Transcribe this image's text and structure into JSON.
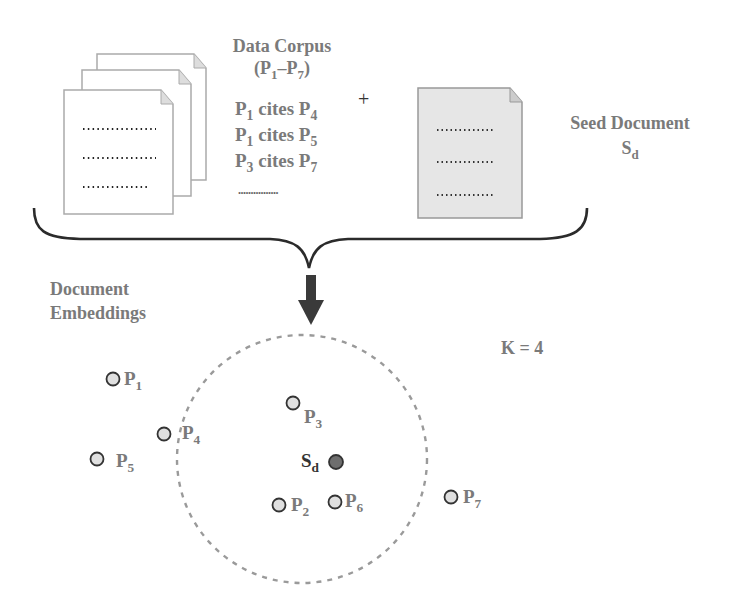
{
  "corpus": {
    "title": "Data Corpus",
    "range": {
      "open": "(",
      "a": "P",
      "a_sub": "1",
      "dash": "–",
      "b": "P",
      "b_sub": "7",
      "close": ")"
    },
    "citations": [
      {
        "src": "P",
        "src_sub": "1",
        "verb": " cites ",
        "dst": "P",
        "dst_sub": "4"
      },
      {
        "src": "P",
        "src_sub": "1",
        "verb": " cites ",
        "dst": "P",
        "dst_sub": "5"
      },
      {
        "src": "P",
        "src_sub": "3",
        "verb": " cites ",
        "dst": "P",
        "dst_sub": "7"
      }
    ],
    "ellipsis": "................"
  },
  "plus": "+",
  "seed": {
    "title": "Seed Document",
    "symbol": "S",
    "symbol_sub": "d"
  },
  "embeddings": {
    "title_line1": "Document",
    "title_line2": "Embeddings"
  },
  "k_label": "K = 4",
  "points": [
    {
      "id": "p1",
      "name": "P",
      "sub": "1"
    },
    {
      "id": "p2",
      "name": "P",
      "sub": "2"
    },
    {
      "id": "p3",
      "name": "P",
      "sub": "3"
    },
    {
      "id": "p4",
      "name": "P",
      "sub": "4"
    },
    {
      "id": "p5",
      "name": "P",
      "sub": "5"
    },
    {
      "id": "p6",
      "name": "P",
      "sub": "6"
    },
    {
      "id": "p7",
      "name": "P",
      "sub": "7"
    }
  ],
  "seed_point": {
    "name": "S",
    "sub": "d"
  },
  "colors": {
    "text_gray": "#7a7a7a",
    "point_fill": "#e0e0e0",
    "seed_fill": "#6e6e6e",
    "circle_dash": "#9a9a9a",
    "seed_doc_fill": "#e6e6e6",
    "arrow": "#3a3a3a"
  }
}
